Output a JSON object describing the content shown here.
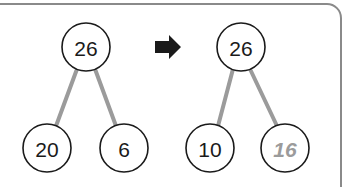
{
  "figure": {
    "background_color": "#ffffff",
    "frame": {
      "name": "rounded-panel-border",
      "stroke_color": "#8a8a8a",
      "stroke_width": 2,
      "corner_radius": 14
    },
    "arrow": {
      "name": "transformation-arrow",
      "glyph": "right-arrow",
      "color": "#1a1a1a",
      "x": 167,
      "y": 47
    },
    "trees": [
      {
        "id": "before-tree",
        "name": "tree-before",
        "nodes": [
          {
            "id": "before-root",
            "label": "26",
            "cx": 86,
            "cy": 47,
            "r": 24,
            "text_color": "#1a1a1a",
            "stroke_color": "#1a1a1a",
            "italic": false,
            "font_size": 21
          },
          {
            "id": "before-left",
            "label": "20",
            "cx": 47,
            "cy": 148,
            "r": 24,
            "text_color": "#1a1a1a",
            "stroke_color": "#1a1a1a",
            "italic": false,
            "font_size": 21
          },
          {
            "id": "before-right",
            "label": "6",
            "cx": 124,
            "cy": 148,
            "r": 24,
            "text_color": "#1a1a1a",
            "stroke_color": "#1a1a1a",
            "italic": false,
            "font_size": 21
          }
        ],
        "edges": [
          {
            "id": "before-edge-left",
            "from": "before-root",
            "to": "before-left",
            "x1": 77,
            "y1": 69,
            "x2": 56,
            "y2": 126,
            "color": "#9b9b9b",
            "width": 4
          },
          {
            "id": "before-edge-right",
            "from": "before-root",
            "to": "before-right",
            "x1": 95,
            "y1": 69,
            "x2": 116,
            "y2": 126,
            "color": "#9b9b9b",
            "width": 4
          }
        ]
      },
      {
        "id": "after-tree",
        "name": "tree-after",
        "nodes": [
          {
            "id": "after-root",
            "label": "26",
            "cx": 241,
            "cy": 47,
            "r": 24,
            "text_color": "#1a1a1a",
            "stroke_color": "#1a1a1a",
            "italic": false,
            "font_size": 21
          },
          {
            "id": "after-left",
            "label": "10",
            "cx": 210,
            "cy": 148,
            "r": 24,
            "text_color": "#1a1a1a",
            "stroke_color": "#1a1a1a",
            "italic": false,
            "font_size": 21
          },
          {
            "id": "after-right",
            "label": "16",
            "cx": 285,
            "cy": 148,
            "r": 24,
            "text_color": "#9b9b9b",
            "stroke_color": "#1a1a1a",
            "italic": true,
            "font_size": 21
          }
        ],
        "edges": [
          {
            "id": "after-edge-left",
            "from": "after-root",
            "to": "after-left",
            "x1": 233,
            "y1": 69,
            "x2": 218,
            "y2": 126,
            "color": "#9b9b9b",
            "width": 4
          },
          {
            "id": "after-edge-right",
            "from": "after-root",
            "to": "after-right",
            "x1": 250,
            "y1": 69,
            "x2": 277,
            "y2": 126,
            "color": "#9b9b9b",
            "width": 4
          }
        ]
      }
    ]
  }
}
